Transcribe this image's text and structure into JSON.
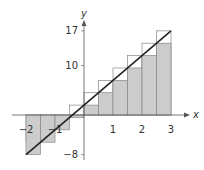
{
  "chart_data": {
    "type": "area",
    "title": "",
    "xlabel": "x",
    "ylabel": "y",
    "function": "y = 5x + 2",
    "xlim": [
      -2,
      3
    ],
    "ylim": [
      -8,
      17
    ],
    "x_ticks": [
      -2,
      -1,
      1,
      2,
      3
    ],
    "x_tick_labels": [
      "−2",
      "−1",
      "1",
      "2",
      "3"
    ],
    "y_ticks": [
      17,
      10,
      -8
    ],
    "y_tick_labels": [
      "17",
      "10",
      "−8"
    ],
    "grid": false,
    "legend": null,
    "line": {
      "x": [
        -2,
        3
      ],
      "y": [
        -8,
        17
      ]
    },
    "rectangles": {
      "width": 0.5,
      "left_edges": [
        -2,
        -1.5,
        -1,
        -0.5,
        0,
        0.5,
        1,
        1.5,
        2,
        2.5
      ],
      "left_endpoint_heights": [
        -8,
        -5.5,
        -3,
        -0.5,
        2,
        4.5,
        7,
        9.5,
        12,
        14.5
      ],
      "right_endpoint_heights": [
        -5.5,
        -3,
        -0.5,
        2,
        4.5,
        7,
        9.5,
        12,
        14.5,
        17
      ],
      "fill_color": "#cccccc",
      "outline_color": "#888888"
    }
  },
  "axes": {
    "x_label": "x",
    "y_label": "y"
  }
}
